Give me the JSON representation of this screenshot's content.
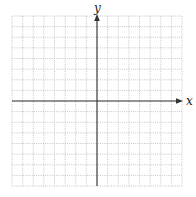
{
  "diagram": {
    "type": "coordinate-grid",
    "grid": {
      "columns": 16,
      "rows": 16,
      "line_style": "dotted",
      "line_color": "#b8b8b8"
    },
    "axes": {
      "color": "#333333",
      "x_label": "x",
      "y_label": "y",
      "origin_column": 8,
      "origin_row": 8,
      "x_arrow": "right",
      "y_arrow": "up"
    }
  }
}
